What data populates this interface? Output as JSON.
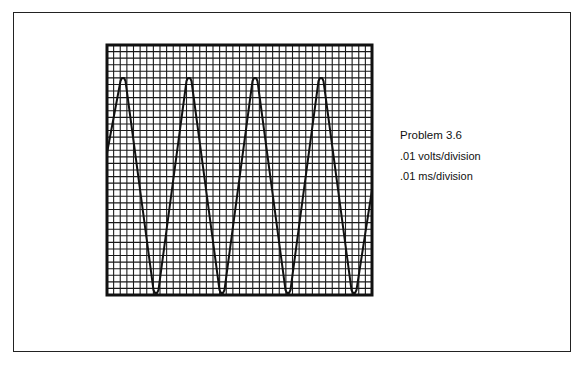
{
  "figure": {
    "title": "Problem 3.6",
    "vertical_scale": ".01 volts/division",
    "horizontal_scale": ".01 ms/division"
  },
  "graticule": {
    "x": 107,
    "y": 45,
    "width": 265,
    "height": 250,
    "columns": 40,
    "rows": 38,
    "line_color": "#1a1a1a",
    "border_color": "#111111"
  },
  "chart_data": {
    "type": "line",
    "title": "Problem 3.6",
    "xlabel": ".01 ms/division",
    "ylabel": ".01 volts/division",
    "waveform": "triangle",
    "grid": true,
    "divisions": {
      "horizontal": 40,
      "vertical": 38
    },
    "period_divisions": 10,
    "peak_to_peak_divisions": 32.5,
    "peaks_px_x": [
      123,
      189,
      255,
      321
    ],
    "troughs_px_x": [
      156,
      222,
      288,
      354
    ],
    "peak_px_y": 78,
    "trough_px_y": 293,
    "start_px": [
      107,
      153
    ],
    "end_px": [
      372,
      190
    ]
  }
}
